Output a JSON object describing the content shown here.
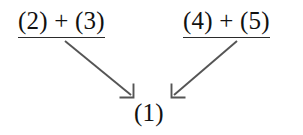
{
  "diagram": {
    "type": "dependency-arrow-diagram",
    "background_color": "#ffffff",
    "text_color": "#111111",
    "arrow_color": "#555555",
    "rule_color": "#2a2a2a",
    "nodes": [
      {
        "id": "left",
        "label": "(2) + (3)",
        "underlined": true,
        "x": 18,
        "y": 8
      },
      {
        "id": "right",
        "label": "(4) + (5)",
        "underlined": true,
        "x": 183,
        "y": 8
      },
      {
        "id": "target",
        "label": "(1)",
        "underlined": false,
        "x": 134,
        "y": 100
      }
    ],
    "arrows": [
      {
        "id": "left-to-target",
        "from": "left",
        "to": "target",
        "direction": "down-right",
        "x1": 65,
        "y1": 41,
        "x2": 134,
        "y2": 98,
        "head": "open-v"
      },
      {
        "id": "right-to-target",
        "from": "right",
        "to": "target",
        "direction": "down-left",
        "x1": 237,
        "y1": 41,
        "x2": 171,
        "y2": 98,
        "head": "open-v"
      }
    ]
  }
}
